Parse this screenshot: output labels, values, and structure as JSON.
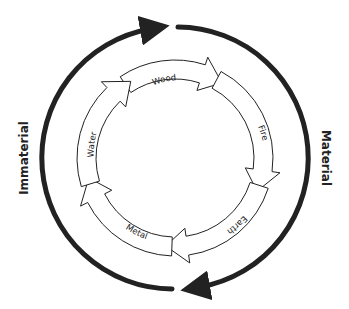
{
  "diagram": {
    "left_label": "Immaterial",
    "right_label": "Material",
    "elements": [
      {
        "name": "Wood"
      },
      {
        "name": "Fire"
      },
      {
        "name": "Earth"
      },
      {
        "name": "Metal"
      },
      {
        "name": "Water"
      }
    ],
    "colors": {
      "stroke": "#222222",
      "background": "#ffffff"
    }
  }
}
